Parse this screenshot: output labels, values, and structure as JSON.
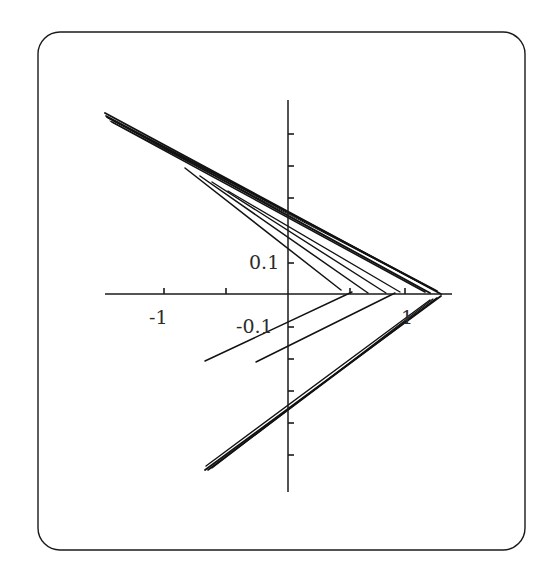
{
  "figure": {
    "background_color": "#ffffff",
    "frame": {
      "stroke_color": "#1a1a1a",
      "stroke_width": 1.4,
      "corner_radius": 22,
      "x": 38,
      "y": 32,
      "width": 487,
      "height": 518
    }
  },
  "chart_data": {
    "type": "line",
    "title": "",
    "subtitle": "",
    "xlabel": "",
    "ylabel": "",
    "grid": false,
    "legend": null,
    "annotations": [],
    "axes": {
      "x_axis": {
        "line_color": "#1a1a1a",
        "pixel_y": 294,
        "pixel_x_start": 105,
        "pixel_x_end": 452,
        "origin_pixel_x": 288,
        "pixels_per_unit": 124,
        "xlim": [
          -1.48,
          1.32
        ],
        "ticks": [
          {
            "value": -1.0,
            "label": "-1",
            "pixel_x": 164,
            "labeled": true
          },
          {
            "value": -0.5,
            "label": "",
            "pixel_x": 226,
            "labeled": false
          },
          {
            "value": 0.5,
            "label": "",
            "pixel_x": 350,
            "labeled": false
          },
          {
            "value": 1.0,
            "label": "1",
            "pixel_x": 405,
            "labeled": true
          }
        ]
      },
      "y_axis": {
        "line_color": "#1a1a1a",
        "pixel_x": 288,
        "pixel_y_start": 100,
        "pixel_y_end": 492,
        "origin_pixel_y": 294,
        "pixels_per_unit": 640,
        "ylim": [
          -0.31,
          0.3
        ],
        "ticks": [
          {
            "value": 0.25,
            "label": "",
            "pixel_y": 134,
            "labeled": false
          },
          {
            "value": 0.2,
            "label": "",
            "pixel_y": 166,
            "labeled": false
          },
          {
            "value": 0.15,
            "label": "",
            "pixel_y": 198,
            "labeled": false
          },
          {
            "value": 0.1,
            "label": "0.1",
            "pixel_y": 263,
            "labeled": true
          },
          {
            "value": -0.1,
            "label": "-0.1",
            "pixel_y": 327,
            "labeled": true
          },
          {
            "value": -0.15,
            "label": "",
            "pixel_y": 359,
            "labeled": false
          },
          {
            "value": -0.2,
            "label": "",
            "pixel_y": 391,
            "labeled": false
          },
          {
            "value": -0.25,
            "label": "",
            "pixel_y": 423,
            "labeled": false
          },
          {
            "value": -0.3,
            "label": "",
            "pixel_y": 455,
            "labeled": false
          }
        ]
      }
    },
    "tick_labels": {
      "x_neg_one": "-1",
      "x_one": "1",
      "y_pos": "0.1",
      "y_neg": "-0.1"
    },
    "vertices": {
      "upper_left_cusp": {
        "pixel_x": 105,
        "pixel_y": 113
      },
      "right_vertex": {
        "pixel_x": 441,
        "pixel_y": 295
      },
      "lower_left_cusp": {
        "pixel_x": 205,
        "pixel_y": 470
      }
    },
    "series": [
      {
        "name": "branch-1-upper-outer",
        "stroke_width": 1.9,
        "points": [
          [
            105,
            113
          ],
          [
            441,
            294
          ]
        ]
      },
      {
        "name": "branch-2-upper-inner",
        "stroke_width": 1.7,
        "points": [
          [
            106,
            116
          ],
          [
            437,
            291
          ]
        ]
      },
      {
        "name": "branch-3-upper-thin",
        "stroke_width": 1.3,
        "points": [
          [
            108,
            118
          ],
          [
            433,
            289
          ]
        ]
      },
      {
        "name": "branch-4-upper-fine",
        "stroke_width": 1.0,
        "points": [
          [
            110,
            121
          ],
          [
            430,
            288
          ]
        ]
      },
      {
        "name": "branch-5-upper-lower-edge",
        "stroke_width": 1.9,
        "points": [
          [
            107,
            117
          ],
          [
            430,
            293
          ]
        ]
      },
      {
        "name": "branch-6-wedge-lower",
        "stroke_width": 1.6,
        "points": [
          [
            112,
            122
          ],
          [
            425,
            292
          ]
        ]
      },
      {
        "name": "branch-7-steep-to-axis-a",
        "stroke_width": 1.5,
        "points": [
          [
            185,
            168
          ],
          [
            341,
            290
          ]
        ]
      },
      {
        "name": "branch-8-steep-to-axis-b",
        "stroke_width": 1.5,
        "points": [
          [
            200,
            176
          ],
          [
            368,
            293
          ]
        ]
      },
      {
        "name": "branch-9-steep-to-axis-c",
        "stroke_width": 1.4,
        "points": [
          [
            212,
            182
          ],
          [
            386,
            293
          ]
        ]
      },
      {
        "name": "branch-10-steep-to-axis-d",
        "stroke_width": 1.3,
        "points": [
          [
            228,
            191
          ],
          [
            400,
            292
          ]
        ]
      },
      {
        "name": "branch-11-lower-open-a",
        "stroke_width": 1.5,
        "points": [
          [
            205,
            361
          ],
          [
            352,
            292
          ]
        ]
      },
      {
        "name": "branch-12-lower-open-b",
        "stroke_width": 1.5,
        "points": [
          [
            256,
            362
          ],
          [
            395,
            293
          ]
        ]
      },
      {
        "name": "branch-13-lower-wedge-outer",
        "stroke_width": 1.8,
        "points": [
          [
            205,
            470
          ],
          [
            441,
            296
          ]
        ]
      },
      {
        "name": "branch-14-lower-wedge-inner",
        "stroke_width": 1.6,
        "points": [
          [
            208,
            470
          ],
          [
            437,
            298
          ]
        ]
      },
      {
        "name": "branch-15-lower-wedge-fine",
        "stroke_width": 1.2,
        "points": [
          [
            212,
            468
          ],
          [
            433,
            299
          ]
        ]
      },
      {
        "name": "branch-16-lower-wedge-tail",
        "stroke_width": 1.4,
        "points": [
          [
            206,
            466
          ],
          [
            430,
            300
          ]
        ]
      }
    ]
  }
}
